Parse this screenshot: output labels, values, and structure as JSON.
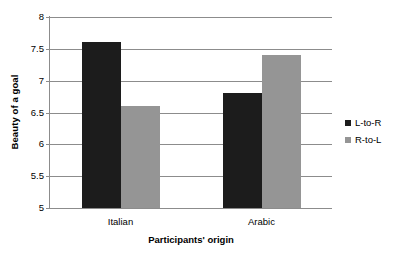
{
  "chart_data": {
    "type": "bar",
    "title": "",
    "xlabel": "Participants' origin",
    "ylabel": "Beauty of a goal",
    "categories": [
      "Italian",
      "Arabic"
    ],
    "series": [
      {
        "name": "L-to-R",
        "color": "#1c1c1c",
        "values": [
          7.6,
          6.8
        ]
      },
      {
        "name": "R-to-L",
        "color": "#959595",
        "values": [
          6.6,
          7.4
        ]
      }
    ],
    "ylim": [
      5,
      8
    ],
    "yticks": [
      "5",
      "5.5",
      "6",
      "6.5",
      "7",
      "7.5",
      "8"
    ],
    "ytick_values": [
      5,
      5.5,
      6,
      6.5,
      7,
      7.5,
      8
    ],
    "grid": true,
    "legend_position": "right",
    "gridline_color": "#8c8c8c",
    "background_color": "#ffffff"
  }
}
